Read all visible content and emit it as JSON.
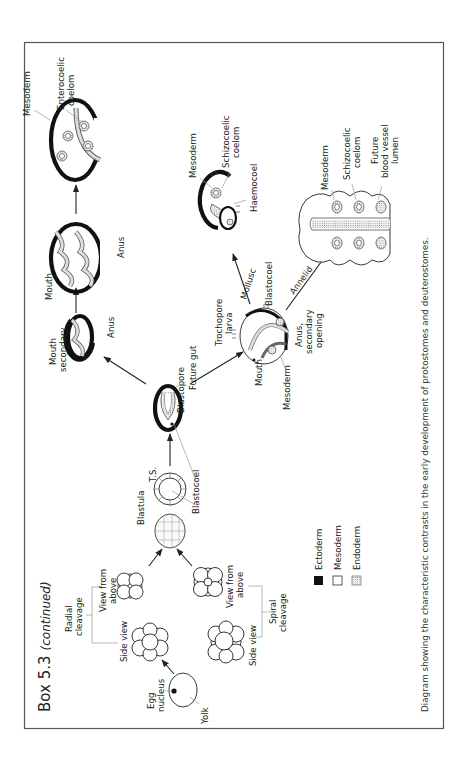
{
  "box": {
    "title": "Box 5.3",
    "title_suffix": "(continued)"
  },
  "caption": "Diagram showing the characteristic contrasts in the early development of protostomes and deuterostomes.",
  "labels": {
    "egg_nucleus_1": "Egg",
    "egg_nucleus_2": "nucleus",
    "yolk": "Yolk",
    "radial_cleavage_1": "Radial",
    "radial_cleavage_2": "cleavage",
    "side_view_radial": "Side view",
    "view_from_above_radial_1": "View from",
    "view_from_above_radial_2": "above",
    "spiral_cleavage_1": "Spiral",
    "spiral_cleavage_2": "cleavage",
    "side_view_spiral": "Side view",
    "view_from_above_spiral_1": "View from",
    "view_from_above_spiral_2": "above",
    "blastula": "Blastula",
    "ts": "T.S.",
    "blastocoel_1": "Blastocoel",
    "blastopore": "Blastopore",
    "future_gut": "Future gut",
    "mouth_secondary_1": "Mouth",
    "mouth_secondary_2": "secondary",
    "anus_1": "Anus",
    "mouth_2": "Mouth",
    "anus_2": "Anus",
    "mesoderm_deut": "Mesoderm",
    "enterocoelic_1": "Enterocoelic",
    "enterocoelic_2": "coelom",
    "trochophore_1": "Trochopore",
    "trochophore_2": "larva",
    "mouth_troch": "Mouth",
    "mesoderm_troch": "Mesoderm",
    "anus_secondary_1": "Anus,",
    "anus_secondary_2": "secondary",
    "anus_secondary_3": "opening",
    "blastocoel_2": "Blastocoel",
    "mollusc": "Mollusc",
    "annelid": "Annelid",
    "mesoderm_moll": "Mesoderm",
    "schizocoelic_moll_1": "Schizocoelic",
    "schizocoelic_moll_2": "coelom",
    "haemocoel": "Haemocoel",
    "mesoderm_ann": "Mesoderm",
    "schizocoelic_ann_1": "Schizocoelic",
    "schizocoelic_ann_2": "coelom",
    "future_bv_1": "Future",
    "future_bv_2": "blood vessel",
    "future_bv_3": "lumen"
  },
  "legend": [
    {
      "label": "Ectoderm",
      "swatch": "#111111"
    },
    {
      "label": "Mesoderm",
      "swatch": "#ffffff"
    },
    {
      "label": "Endoderm",
      "swatch": "dotted"
    }
  ],
  "colors": {
    "border": "#555555",
    "ink": "#222222"
  }
}
